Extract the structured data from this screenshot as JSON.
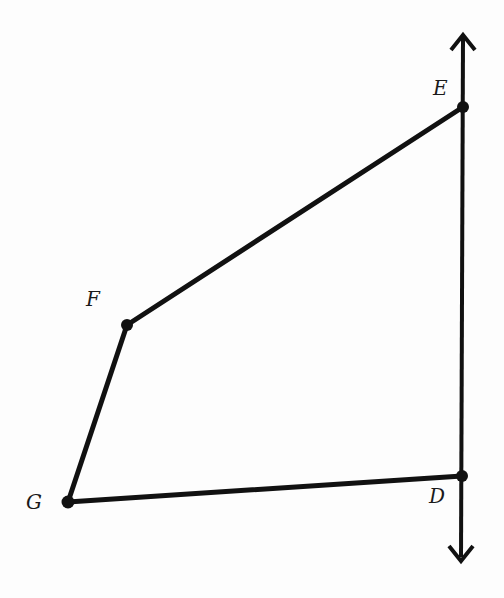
{
  "diagram": {
    "type": "quadrilateral-with-line",
    "colors": {
      "stroke": "#111111",
      "background": "#fdfdfd"
    },
    "points": [
      {
        "name": "E",
        "x": 463,
        "y": 107,
        "label_x": 433,
        "label_y": 95
      },
      {
        "name": "F",
        "x": 127,
        "y": 325,
        "label_x": 86,
        "label_y": 306
      },
      {
        "name": "G",
        "x": 68,
        "y": 502,
        "label_x": 26,
        "label_y": 509
      },
      {
        "name": "D",
        "x": 462,
        "y": 476,
        "label_x": 429,
        "label_y": 503
      }
    ],
    "segments": [
      [
        "E",
        "F"
      ],
      [
        "F",
        "G"
      ],
      [
        "G",
        "D"
      ]
    ],
    "line": {
      "through": [
        "E",
        "D"
      ],
      "top": {
        "x": 463,
        "y": 33
      },
      "bottom": {
        "x": 461,
        "y": 562
      },
      "arrows": "both"
    }
  }
}
